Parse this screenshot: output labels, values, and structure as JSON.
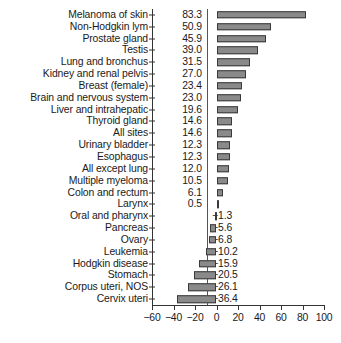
{
  "chart_data": {
    "type": "bar",
    "orientation": "horizontal",
    "title": "",
    "subtitle": "",
    "xlabel": "",
    "ylabel": "",
    "xlim": [
      -60,
      100
    ],
    "xticks": [
      "-60",
      "-40",
      "-20",
      "0",
      "20",
      "40",
      "60",
      "80",
      "100"
    ],
    "xtick_values": [
      -60,
      -40,
      -20,
      0,
      20,
      40,
      60,
      80,
      100
    ],
    "grid": false,
    "legend": null,
    "zero_reference_line": true,
    "bar_color": "#8a8a8a",
    "bar_edge_color": "#3a3a3a",
    "axis_color": "#333333",
    "background_color": "#ffffff",
    "categories": [
      "Melanoma of skin",
      "Non-Hodgkin lym",
      "Prostate gland",
      "Testis",
      "Lung and bronchus",
      "Kidney and renal pelvis",
      "Breast (female)",
      "Brain and nervous system",
      "Liver and intrahepatic",
      "Thyroid gland",
      "All sites",
      "Urinary bladder",
      "Esophagus",
      "All except lung",
      "Multiple myeloma",
      "Colon and rectum",
      "Larynx",
      "Oral and pharynx",
      "Pancreas",
      "Ovary",
      "Leukemia",
      "Hodgkin disease",
      "Stomach",
      "Corpus uteri, NOS",
      "Cervix uteri"
    ],
    "values": [
      83.3,
      50.9,
      45.9,
      39.0,
      31.5,
      27.0,
      23.4,
      23.0,
      19.6,
      14.6,
      14.6,
      12.3,
      12.3,
      12.0,
      10.5,
      6.1,
      0.5,
      -1.3,
      -5.6,
      -6.8,
      -10.2,
      -15.9,
      -20.5,
      -26.1,
      -36.4
    ],
    "value_labels": [
      "83.3",
      "50.9",
      "45.9",
      "39.0",
      "31.5",
      "27.0",
      "23.4",
      "23.0",
      "19.6",
      "14.6",
      "14.6",
      "12.3",
      "12.3",
      "12.0",
      "10.5",
      "6.1",
      "0.5",
      "−1.3",
      "−5.6",
      "−6.8",
      "−10.2",
      "−15.9",
      "−20.5",
      "−26.1",
      "−36.4"
    ]
  }
}
